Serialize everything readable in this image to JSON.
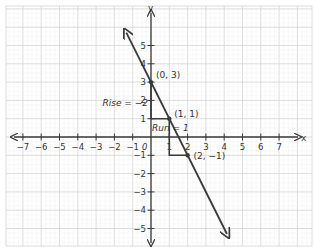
{
  "diagram": {
    "type": "coordinate-plane-line-slope",
    "axes": {
      "x_label": "x",
      "y_label": "y",
      "x_ticks": [
        "-7",
        "-6",
        "-5",
        "-4",
        "-3",
        "-2",
        "-1",
        "1",
        "2",
        "3",
        "4",
        "5",
        "6",
        "7"
      ],
      "y_ticks": [
        "5",
        "4",
        "3",
        "2",
        "1",
        "-1",
        "-2",
        "-3",
        "-4",
        "-5"
      ],
      "origin_label": "0"
    },
    "points": [
      {
        "label": "(0, 3)",
        "x": 0,
        "y": 3
      },
      {
        "label": "(1, 1)",
        "x": 1,
        "y": 1
      },
      {
        "label": "(2, -1)",
        "x": 2,
        "y": -1
      }
    ],
    "annotations": {
      "rise": "Rise = -2",
      "run": "Run = 1"
    },
    "line": {
      "slope": -2,
      "intercept": 3,
      "color": "#3a3a3a"
    },
    "colors": {
      "grid": "#e6e6e6",
      "grid_major": "#d4d4d4",
      "axis": "#3a3a3a",
      "text": "#333333"
    }
  }
}
